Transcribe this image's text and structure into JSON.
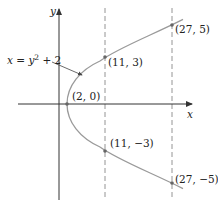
{
  "diagram": {
    "equation_label": "x = y² + 2",
    "equation_parts": {
      "lhs": "x = y",
      "exp": "2",
      "rhs": " + 2"
    },
    "axes": {
      "x_label": "x",
      "y_label": "y"
    },
    "points": [
      {
        "label": "(2, 0)",
        "x": 2,
        "y": 0
      },
      {
        "label": "(11, 3)",
        "x": 11,
        "y": 3
      },
      {
        "label": "(27, 5)",
        "x": 27,
        "y": 5
      },
      {
        "label": "(11, −3)",
        "x": 11,
        "y": -3
      },
      {
        "label": "(27, −5)",
        "x": 27,
        "y": -5
      }
    ],
    "dashed_lines": [
      {
        "x": 11
      },
      {
        "x": 27
      }
    ],
    "colors": {
      "curve": "#9a9a9a",
      "axes": "#333333",
      "dashed": "#888888",
      "points": "#666666"
    }
  }
}
